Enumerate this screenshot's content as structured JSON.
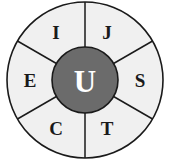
{
  "diagram": {
    "name": "segmented-wheel-diagram",
    "type": "radial-wheel",
    "outer_circle": {
      "fill": "#f0f0f0",
      "stroke": "#1a1a1a",
      "cx": 85,
      "cy": 80,
      "r": 78
    },
    "hub": {
      "label": "U",
      "fill": "#6b6b6b",
      "stroke": "#1a1a1a",
      "text_color": "#ffffff",
      "cx": 85,
      "cy": 80,
      "r": 33
    },
    "sectors": [
      {
        "label": "I",
        "angle_deg": 240,
        "label_x": 56,
        "label_y": 32
      },
      {
        "label": "J",
        "angle_deg": 300,
        "label_x": 107,
        "label_y": 32
      },
      {
        "label": "S",
        "angle_deg": 0,
        "label_x": 140,
        "label_y": 80
      },
      {
        "label": "T",
        "angle_deg": 60,
        "label_x": 107,
        "label_y": 128
      },
      {
        "label": "C",
        "angle_deg": 120,
        "label_x": 56,
        "label_y": 128
      },
      {
        "label": "E",
        "angle_deg": 180,
        "label_x": 30,
        "label_y": 80
      }
    ],
    "spokes": [
      {
        "angle_deg": 270
      },
      {
        "angle_deg": 330
      },
      {
        "angle_deg": 30
      },
      {
        "angle_deg": 90
      },
      {
        "angle_deg": 150
      },
      {
        "angle_deg": 210
      }
    ]
  }
}
